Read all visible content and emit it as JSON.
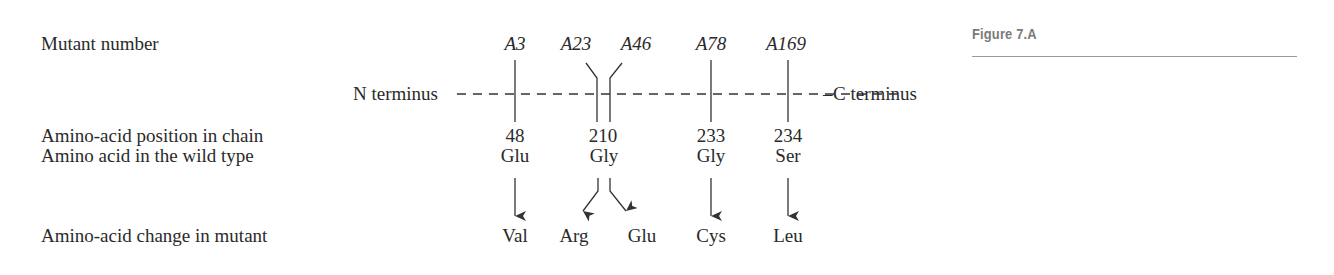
{
  "figure": {
    "label": "Figure 7.A"
  },
  "rows": {
    "mutant_number": "Mutant number",
    "position": "Amino-acid position in chain",
    "wild_type": "Amino acid in the wild type",
    "change": "Amino-acid change in mutant"
  },
  "chain": {
    "n_terminus": "N terminus",
    "c_terminus": "C terminus"
  },
  "mutants": [
    {
      "name": "A3",
      "position": "48",
      "wild_type": "Glu",
      "mutant_aa": "Val"
    },
    {
      "name": "A23",
      "position": "210",
      "wild_type": "Gly",
      "mutant_aa": "Arg"
    },
    {
      "name": "A46",
      "position": "210",
      "wild_type": "Gly",
      "mutant_aa": "Glu"
    },
    {
      "name": "A78",
      "position": "233",
      "wild_type": "Gly",
      "mutant_aa": "Cys"
    },
    {
      "name": "A169",
      "position": "234",
      "wild_type": "Ser",
      "mutant_aa": "Leu"
    }
  ],
  "positions": [
    "48",
    "210",
    "233",
    "234"
  ],
  "wild_types": [
    "Glu",
    "Gly",
    "Gly",
    "Ser"
  ],
  "colors": {
    "text": "#2a2a2a",
    "line": "#333333",
    "figure_label": "#7a7a7a",
    "figure_rule": "#9a9a9a"
  }
}
